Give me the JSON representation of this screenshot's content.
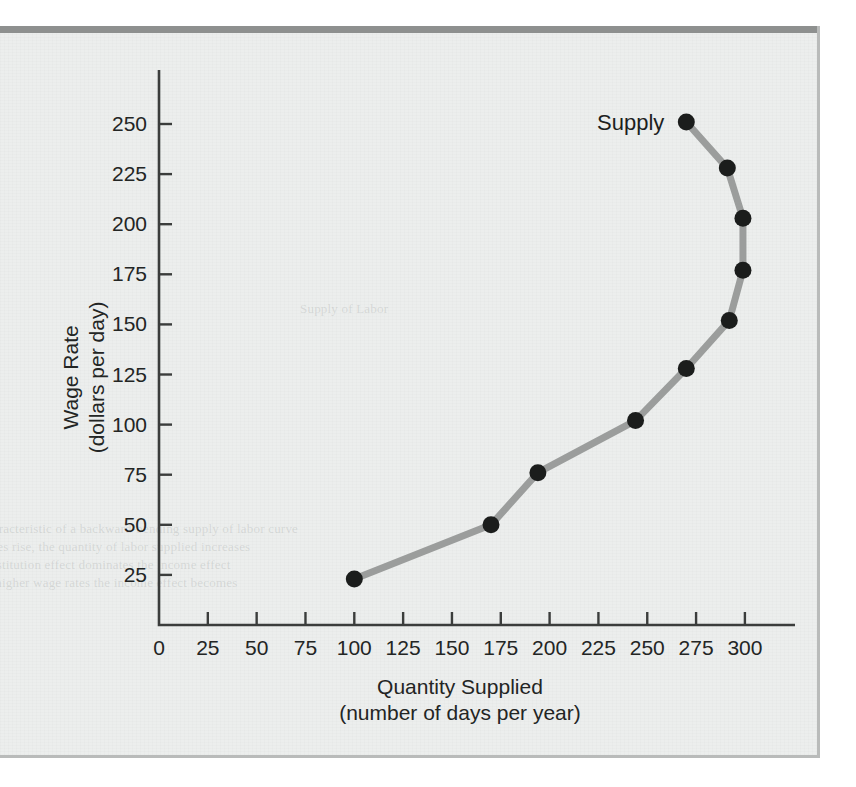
{
  "figure": {
    "background_color": "#eceeed",
    "rule_color": "#8e908f"
  },
  "chart_data": {
    "type": "line",
    "title": "",
    "xlabel": "Quantity Supplied",
    "xlabel_sub": "(number of days per year)",
    "ylabel": "Wage Rate",
    "ylabel_sub": "(dollars per day)",
    "xlim": [
      0,
      310
    ],
    "ylim": [
      0,
      265
    ],
    "xticks": [
      0,
      25,
      50,
      75,
      100,
      125,
      150,
      175,
      200,
      225,
      250,
      275,
      300
    ],
    "yticks": [
      25,
      50,
      75,
      100,
      125,
      150,
      175,
      200,
      225,
      250
    ],
    "grid": false,
    "legend_position": "inline-left-of-top-point",
    "series": [
      {
        "name": "Supply",
        "line_color": "#9b9d9c",
        "marker_color": "#1b1d1c",
        "x": [
          100,
          170,
          194,
          244,
          270,
          292,
          299,
          299,
          291,
          270
        ],
        "y": [
          23,
          50,
          76,
          102,
          128,
          152,
          177,
          203,
          228,
          251
        ]
      }
    ],
    "annotations": [
      {
        "text": "Supply",
        "x": 270,
        "y": 251,
        "placement": "left"
      }
    ]
  },
  "bleed_text": {
    "line_a": "Supply of Labor",
    "line_b": "characteristic of a backward-bending supply of labor curve",
    "line_c": "wages rise, the quantity of labor supplied increases",
    "line_d": "substitution effect dominates the income effect",
    "line_e": "at higher wage rates the income effect becomes"
  }
}
